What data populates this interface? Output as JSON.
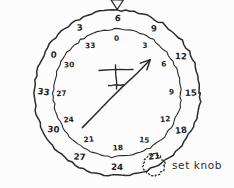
{
  "instrument": {
    "name": "heading-indicator-dial",
    "style": "hand-drawn-sketch",
    "ink_color": "#2b2b2b",
    "background_color": "#fcfcfc",
    "center": {
      "x": 117,
      "y": 93
    },
    "outer_ring_radius": 83,
    "inner_ring_radius": 64,
    "index_marker": {
      "name": "triangle-index",
      "glyph": "triangle-down",
      "position": "top"
    },
    "outer_scale": {
      "name": "outer-compass-ring",
      "radius": 74,
      "ticks": [
        {
          "label": "6",
          "angle_deg": 0
        },
        {
          "label": "9",
          "angle_deg": 30
        },
        {
          "label": "12",
          "angle_deg": 60
        },
        {
          "label": "15",
          "angle_deg": 90
        },
        {
          "label": "18",
          "angle_deg": 120
        },
        {
          "label": "21",
          "angle_deg": 150
        },
        {
          "label": "24",
          "angle_deg": 180
        },
        {
          "label": "27",
          "angle_deg": 210
        },
        {
          "label": "30",
          "angle_deg": 240
        },
        {
          "label": "33",
          "angle_deg": 270
        },
        {
          "label": "0",
          "angle_deg": 300
        },
        {
          "label": "3",
          "angle_deg": 330
        }
      ]
    },
    "inner_scale": {
      "name": "inner-compass-ring",
      "radius": 55,
      "ticks": [
        {
          "label": "0",
          "angle_deg": 0
        },
        {
          "label": "3",
          "angle_deg": 30
        },
        {
          "label": "6",
          "angle_deg": 60
        },
        {
          "label": "9",
          "angle_deg": 90
        },
        {
          "label": "12",
          "angle_deg": 120
        },
        {
          "label": "15",
          "angle_deg": 150
        },
        {
          "label": "18",
          "angle_deg": 180
        },
        {
          "label": "21",
          "angle_deg": 210
        },
        {
          "label": "24",
          "angle_deg": 240
        },
        {
          "label": "27",
          "angle_deg": 270
        },
        {
          "label": "30",
          "angle_deg": 300
        },
        {
          "label": "33",
          "angle_deg": 330
        }
      ]
    },
    "aircraft_symbol": {
      "name": "aircraft-symbol",
      "description": "vertical stem with long upper crossbar and short lower crossbar"
    },
    "pointer": {
      "name": "heading-pointer-needle",
      "tail_angle_deg": 225,
      "head_angle_deg": 45,
      "points_toward": "6"
    }
  },
  "annotations": {
    "set_knob": {
      "label": "set knob",
      "marker": "circle-outline"
    }
  }
}
